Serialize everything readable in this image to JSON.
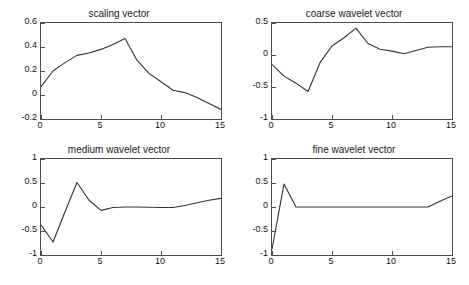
{
  "figure": {
    "width": 469,
    "height": 285,
    "background": "#ffffff",
    "line_color": "#333333",
    "axis_color": "#4d4d4d",
    "text_color": "#111111",
    "layout": "2x2 subplot grid"
  },
  "chart_data": [
    {
      "type": "line",
      "title": "scaling vector",
      "xlabel": "",
      "ylabel": "",
      "xlim": [
        0,
        15
      ],
      "ylim": [
        -0.2,
        0.6
      ],
      "xticks": [
        0,
        5,
        10,
        15
      ],
      "xtick_labels": [
        "0",
        "5",
        "10",
        "15"
      ],
      "yticks": [
        -0.2,
        0,
        0.2,
        0.4,
        0.6
      ],
      "ytick_labels": [
        "-0.2",
        "0",
        "0.2",
        "0.4",
        "0.6"
      ],
      "grid": false,
      "legend": false,
      "x": [
        0,
        1,
        2,
        3,
        4,
        5,
        6,
        7,
        8,
        9,
        10,
        11,
        12,
        13,
        14,
        15
      ],
      "values": [
        0.07,
        0.2,
        0.27,
        0.33,
        0.35,
        0.38,
        0.42,
        0.47,
        0.29,
        0.18,
        0.11,
        0.04,
        0.02,
        -0.02,
        -0.07,
        -0.12
      ]
    },
    {
      "type": "line",
      "title": "coarse wavelet vector",
      "xlabel": "",
      "ylabel": "",
      "xlim": [
        0,
        15
      ],
      "ylim": [
        -1,
        0.5
      ],
      "xticks": [
        0,
        5,
        10,
        15
      ],
      "xtick_labels": [
        "0",
        "5",
        "10",
        "15"
      ],
      "yticks": [
        -1,
        -0.5,
        0,
        0.5
      ],
      "ytick_labels": [
        "-1",
        "-0.5",
        "0",
        "0.5"
      ],
      "grid": false,
      "legend": false,
      "x": [
        0,
        1,
        2,
        3,
        4,
        5,
        6,
        7,
        8,
        9,
        10,
        11,
        12,
        13,
        14,
        15
      ],
      "values": [
        -0.15,
        -0.33,
        -0.44,
        -0.57,
        -0.12,
        0.14,
        0.27,
        0.42,
        0.18,
        0.09,
        0.06,
        0.02,
        0.07,
        0.12,
        0.13,
        0.13
      ]
    },
    {
      "type": "line",
      "title": "medium wavelet vector",
      "xlabel": "",
      "ylabel": "",
      "xlim": [
        0,
        15
      ],
      "ylim": [
        -1,
        1
      ],
      "xticks": [
        0,
        5,
        10,
        15
      ],
      "xtick_labels": [
        "0",
        "5",
        "10",
        "15"
      ],
      "yticks": [
        -1,
        -0.5,
        0,
        0.5,
        1
      ],
      "ytick_labels": [
        "-1",
        "-0.5",
        "0",
        "0.5",
        "1"
      ],
      "grid": false,
      "legend": false,
      "x": [
        0,
        1,
        2,
        3,
        4,
        5,
        6,
        7,
        8,
        9,
        10,
        11,
        12,
        13,
        14,
        15
      ],
      "values": [
        -0.37,
        -0.73,
        -0.1,
        0.51,
        0.14,
        -0.07,
        -0.01,
        0.0,
        0.0,
        -0.005,
        -0.01,
        -0.01,
        0.03,
        0.09,
        0.14,
        0.18
      ]
    },
    {
      "type": "line",
      "title": "fine wavelet vector",
      "xlabel": "",
      "ylabel": "",
      "xlim": [
        0,
        15
      ],
      "ylim": [
        -1,
        1
      ],
      "xticks": [
        0,
        5,
        10,
        15
      ],
      "xtick_labels": [
        "0",
        "5",
        "10",
        "15"
      ],
      "yticks": [
        -1,
        -0.5,
        0,
        0.5,
        1
      ],
      "ytick_labels": [
        "-1",
        "-0.5",
        "0",
        "0.5",
        "1"
      ],
      "grid": false,
      "legend": false,
      "x": [
        0,
        1,
        2,
        3,
        4,
        5,
        6,
        7,
        8,
        9,
        10,
        11,
        12,
        13,
        14,
        15
      ],
      "values": [
        -0.88,
        0.48,
        0.0,
        0.0,
        0.0,
        0.0,
        0.0,
        0.0,
        0.0,
        0.0,
        0.0,
        0.0,
        0.0,
        0.0,
        0.12,
        0.23
      ]
    }
  ]
}
